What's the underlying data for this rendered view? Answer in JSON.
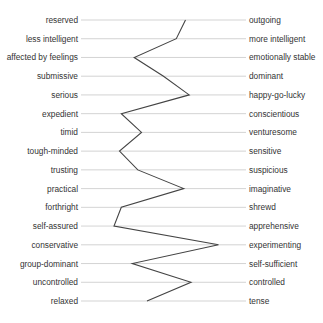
{
  "chart_data": {
    "type": "line",
    "title": "",
    "xlabel": "",
    "ylabel": "",
    "orientation": "horizontal-profile",
    "xlim": [
      1,
      10
    ],
    "grid": true,
    "legend": null,
    "categories": [
      {
        "left": "reserved",
        "right": "outgoing"
      },
      {
        "left": "less intelligent",
        "right": "more intelligent"
      },
      {
        "left": "affected by feelings",
        "right": "emotionally stable"
      },
      {
        "left": "submissive",
        "right": "dominant"
      },
      {
        "left": "serious",
        "right": "happy-go-lucky"
      },
      {
        "left": "expedient",
        "right": "conscientious"
      },
      {
        "left": "timid",
        "right": "venturesome"
      },
      {
        "left": "tough-minded",
        "right": "sensitive"
      },
      {
        "left": "trusting",
        "right": "suspicious"
      },
      {
        "left": "practical",
        "right": "imaginative"
      },
      {
        "left": "forthright",
        "right": "shrewd"
      },
      {
        "left": "self-assured",
        "right": "apprehensive"
      },
      {
        "left": "conservative",
        "right": "experimenting"
      },
      {
        "left": "group-dominant",
        "right": "self-sufficient"
      },
      {
        "left": "uncontrolled",
        "right": "controlled"
      },
      {
        "left": "relaxed",
        "right": "tense"
      }
    ],
    "series": [
      {
        "name": "profile",
        "values": [
          6.7,
          6.2,
          3.9,
          5.5,
          6.9,
          3.2,
          4.3,
          3.1,
          4.1,
          6.6,
          3.2,
          2.8,
          8.5,
          3.8,
          7.0,
          4.6
        ]
      }
    ]
  },
  "colors": {
    "gridline": "#c8c8c8",
    "profile_line": "#444444",
    "text": "#333333"
  }
}
